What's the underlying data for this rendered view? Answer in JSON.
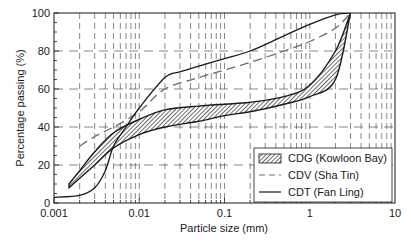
{
  "chart_data": {
    "type": "line",
    "title": "",
    "xlabel": "Particle size (mm)",
    "ylabel": "Percentage passing (%)",
    "xscale": "log",
    "xlim": [
      0.001,
      10
    ],
    "ylim": [
      0,
      100
    ],
    "x_ticks": [
      "0.001",
      "0.01",
      "0.1",
      "1",
      "10"
    ],
    "y_ticks": [
      "0",
      "20",
      "40",
      "60",
      "80",
      "100"
    ],
    "grid": true,
    "grid_style": "dashed",
    "legend_position": "lower right",
    "series": [
      {
        "name": "CDG (Kowloon Bay)",
        "style": "hatched band",
        "upper": {
          "x": [
            0.0015,
            0.002,
            0.003,
            0.005,
            0.01,
            0.02,
            0.05,
            0.1,
            0.2,
            0.5,
            1,
            2,
            3
          ],
          "y": [
            10,
            17,
            27,
            37,
            44,
            49,
            51,
            52,
            53,
            56,
            62,
            80,
            100
          ]
        },
        "lower": {
          "x": [
            0.0015,
            0.002,
            0.003,
            0.005,
            0.01,
            0.02,
            0.05,
            0.1,
            0.2,
            0.5,
            1,
            2,
            3
          ],
          "y": [
            8,
            13,
            20,
            29,
            36,
            40,
            43,
            46,
            48,
            52,
            56,
            65,
            100
          ]
        }
      },
      {
        "name": "CDV (Sha Tin)",
        "style": "dashed",
        "x": [
          0.002,
          0.003,
          0.005,
          0.01,
          0.02,
          0.05,
          0.1,
          0.2,
          0.5,
          1,
          2,
          3
        ],
        "y": [
          30,
          35,
          40,
          48,
          60,
          66,
          70,
          74,
          80,
          85,
          92,
          100
        ]
      },
      {
        "name": "CDT (Fan Ling)",
        "style": "solid",
        "x": [
          0.001,
          0.002,
          0.003,
          0.004,
          0.005,
          0.007,
          0.01,
          0.02,
          0.03,
          0.05,
          0.1,
          0.2,
          0.5,
          1,
          2,
          3
        ],
        "y": [
          3,
          4,
          8,
          17,
          30,
          40,
          50,
          66,
          69,
          72,
          76,
          80,
          88,
          94,
          99,
          100
        ]
      }
    ]
  },
  "axes": {
    "xlabel": "Particle size (mm)",
    "ylabel": "Percentage passing (%)",
    "x_ticks": [
      "0.001",
      "0.01",
      "0.1",
      "1",
      "10"
    ],
    "y_ticks": [
      "0",
      "20",
      "40",
      "60",
      "80",
      "100"
    ]
  },
  "legend": {
    "items": [
      {
        "label": "CDG (Kowloon Bay)",
        "symbol": "hatched-box"
      },
      {
        "label": "CDV (Sha Tin)",
        "symbol": "dashed-line"
      },
      {
        "label": "CDT (Fan Ling)",
        "symbol": "solid-line"
      }
    ]
  },
  "colors": {
    "ink": "#1a1a1a",
    "cdv_line": "#6b6b6b",
    "grid": "#555555",
    "background": "#ffffff"
  }
}
